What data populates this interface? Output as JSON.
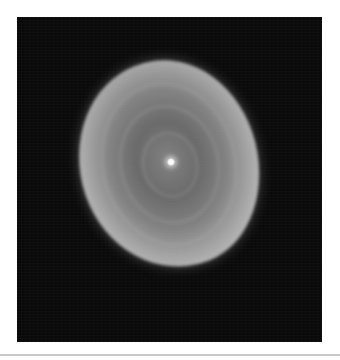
{
  "image": {
    "subject": "planetary nebula",
    "description": "Grayscale astronomical image of an oval, shell-like nebula with a bright central star on a black background",
    "colors": {
      "background": "#ffffff",
      "frame": "#0a0a0a",
      "nebula_rim": "#d7d7d7",
      "nebula_core": "#828282",
      "central_star": "#ffffff",
      "rule": "#c8c8c8"
    }
  }
}
